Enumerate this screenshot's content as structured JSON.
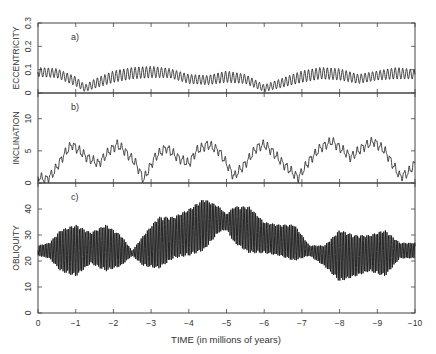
{
  "chart_data": [
    {
      "type": "line",
      "panel_label": "a)",
      "ylabel": "ECCENTRICITY",
      "ylim": [
        0,
        0.3
      ],
      "yticks": [
        0,
        0.1,
        0.2,
        0.3
      ],
      "ytick_labels": [
        "0",
        "0.1",
        "0.2",
        "0.3"
      ],
      "xlim": [
        0,
        -10
      ],
      "grid": false,
      "envelope_x": [
        0,
        -0.5,
        -1.0,
        -1.25,
        -1.5,
        -2.0,
        -2.5,
        -3.0,
        -3.5,
        -4.0,
        -4.5,
        -5.0,
        -5.5,
        -6.0,
        -6.5,
        -7.0,
        -7.5,
        -8.0,
        -8.5,
        -9.0,
        -9.5,
        -10
      ],
      "mean_values": [
        0.09,
        0.085,
        0.05,
        0.02,
        0.04,
        0.07,
        0.085,
        0.09,
        0.085,
        0.06,
        0.055,
        0.07,
        0.06,
        0.02,
        0.045,
        0.07,
        0.085,
        0.08,
        0.06,
        0.075,
        0.085,
        0.08
      ],
      "amplitude": [
        0.02,
        0.02,
        0.02,
        0.015,
        0.02,
        0.025,
        0.025,
        0.025,
        0.02,
        0.02,
        0.02,
        0.025,
        0.02,
        0.015,
        0.02,
        0.025,
        0.025,
        0.025,
        0.02,
        0.02,
        0.025,
        0.02
      ],
      "period_myr": 0.1
    },
    {
      "type": "line",
      "panel_label": "b)",
      "ylabel": "INCLINATION",
      "ylim": [
        0,
        14
      ],
      "yticks": [
        0,
        5,
        10
      ],
      "ytick_labels": [
        "0",
        "5",
        "10"
      ],
      "xlim": [
        0,
        -10
      ],
      "grid": false,
      "envelope_x": [
        0,
        -0.2,
        -0.4,
        -0.7,
        -0.9,
        -1.1,
        -1.3,
        -1.6,
        -1.9,
        -2.1,
        -2.3,
        -2.6,
        -2.8,
        -3.1,
        -3.4,
        -3.7,
        -4.0,
        -4.2,
        -4.5,
        -4.8,
        -5.0,
        -5.2,
        -5.5,
        -5.8,
        -6.0,
        -6.2,
        -6.5,
        -6.9,
        -7.2,
        -7.5,
        -7.8,
        -8.0,
        -8.3,
        -8.6,
        -8.9,
        -9.2,
        -9.4,
        -9.6,
        -9.8,
        -10
      ],
      "mean_values": [
        1.0,
        0.5,
        1.5,
        4.5,
        6.0,
        5.0,
        4.0,
        3.0,
        5.0,
        6.0,
        5.0,
        3.0,
        0.5,
        4.0,
        5.5,
        4.0,
        3.0,
        5.0,
        6.0,
        5.0,
        3.0,
        1.0,
        3.0,
        5.5,
        6.0,
        5.0,
        3.0,
        0.8,
        3.5,
        5.5,
        6.5,
        5.5,
        4.0,
        5.5,
        6.5,
        5.0,
        3.0,
        1.0,
        1.5,
        3.0
      ],
      "amplitude": 0.6,
      "period_myr": 0.125
    },
    {
      "type": "line",
      "panel_label": "c)",
      "ylabel": "OBLIQUITY",
      "ylim": [
        0,
        50
      ],
      "yticks": [
        0,
        10,
        20,
        30,
        40
      ],
      "ytick_labels": [
        "0",
        "10",
        "20",
        "30",
        "40"
      ],
      "xlim": [
        0,
        -10
      ],
      "grid": false,
      "envelope_x": [
        0,
        -0.3,
        -0.6,
        -1.0,
        -1.4,
        -1.8,
        -2.2,
        -2.5,
        -2.8,
        -3.2,
        -3.6,
        -4.0,
        -4.4,
        -4.8,
        -5.0,
        -5.2,
        -5.6,
        -6.0,
        -6.4,
        -6.8,
        -7.2,
        -7.6,
        -8.0,
        -8.4,
        -8.8,
        -9.2,
        -9.6,
        -10
      ],
      "mean_values": [
        24,
        24,
        24,
        24,
        25,
        25,
        24,
        23,
        24,
        27,
        29,
        31,
        34,
        36,
        35,
        34,
        32,
        29,
        28,
        27,
        24,
        22,
        22,
        22,
        23,
        23,
        24,
        24
      ],
      "amplitude": [
        2,
        3,
        8,
        10,
        6,
        9,
        6,
        1,
        6,
        10,
        8,
        9,
        10,
        5,
        3,
        7,
        9,
        6,
        6,
        7,
        2,
        4,
        10,
        8,
        7,
        9,
        3,
        3
      ],
      "period_myr": 0.041
    }
  ],
  "xaxis": {
    "label": "TIME (in millions of years)",
    "ticks": [
      0,
      -1,
      -2,
      -3,
      -4,
      -5,
      -6,
      -7,
      -8,
      -9,
      -10
    ],
    "tick_labels": [
      "0",
      "−1",
      "−2",
      "−3",
      "−4",
      "−5",
      "−6",
      "−7",
      "−8",
      "−9",
      "−10"
    ]
  },
  "colors": {
    "line": "#1a1a1a",
    "axis": "#444444",
    "text": "#333333"
  }
}
